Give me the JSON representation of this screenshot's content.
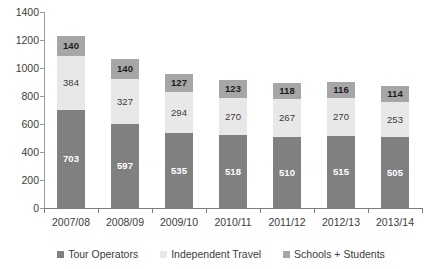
{
  "chart_data": {
    "type": "bar",
    "stacked": true,
    "title": "",
    "subtitle": "",
    "xlabel": "",
    "ylabel": "",
    "ylim": [
      0,
      1400
    ],
    "ytick_step": 200,
    "yticks": [
      0,
      200,
      400,
      600,
      800,
      1000,
      1200,
      1400
    ],
    "ytick_labels": [
      "0",
      "200",
      "400",
      "600",
      "800",
      "1000",
      "1200",
      "1400"
    ],
    "grid": false,
    "legend_position": "bottom",
    "categories": [
      "2007/08",
      "2008/09",
      "2009/10",
      "2010/11",
      "2011/12",
      "2012/13",
      "2013/14"
    ],
    "series": [
      {
        "name": "Tour Operators",
        "color": "#808080",
        "values": [
          703,
          597,
          535,
          518,
          510,
          515,
          505
        ],
        "labels": [
          "703",
          "597",
          "535",
          "518",
          "510",
          "515",
          "505"
        ]
      },
      {
        "name": "Independent Travel",
        "color": "#e8e8e8",
        "values": [
          384,
          327,
          294,
          270,
          267,
          270,
          253
        ],
        "labels": [
          "384",
          "327",
          "294",
          "270",
          "267",
          "270",
          "253"
        ]
      },
      {
        "name": "Schools + Students",
        "color": "#a6a6a6",
        "values": [
          140,
          140,
          127,
          123,
          118,
          116,
          114
        ],
        "labels": [
          "140",
          "140",
          "127",
          "123",
          "118",
          "116",
          "114"
        ]
      }
    ],
    "totals": [
      1227,
      1064,
      956,
      911,
      895,
      901,
      872
    ]
  },
  "legend": {
    "items": [
      {
        "label": "Tour Operators",
        "color": "#808080"
      },
      {
        "label": "Independent Travel",
        "color": "#e8e8e8"
      },
      {
        "label": "Schools + Students",
        "color": "#a6a6a6"
      }
    ]
  },
  "axis": {
    "line_color": "#8a8a8a"
  }
}
